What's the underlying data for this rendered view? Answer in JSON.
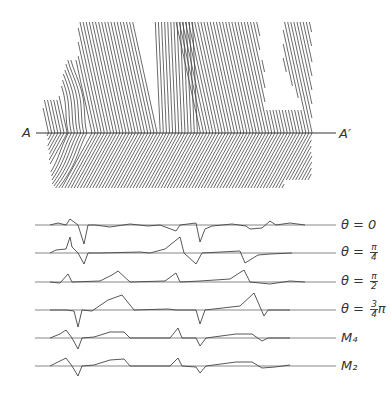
{
  "figure": {
    "section_line": {
      "start_label": "A",
      "end_label": "A′"
    },
    "traces": [
      {
        "name": "theta-0",
        "label_prefix": "θ = ",
        "label_main": "0",
        "frac": null,
        "suffix": ""
      },
      {
        "name": "theta-pi-4",
        "label_prefix": "θ = ",
        "label_main": "",
        "frac": {
          "num": "π",
          "den": "4"
        },
        "suffix": ""
      },
      {
        "name": "theta-pi-2",
        "label_prefix": "θ = ",
        "label_main": "",
        "frac": {
          "num": "π",
          "den": "2"
        },
        "suffix": ""
      },
      {
        "name": "theta-3pi-4",
        "label_prefix": "θ = ",
        "label_main": "",
        "frac": {
          "num": "3",
          "den": "4"
        },
        "suffix": "π"
      },
      {
        "name": "m4",
        "label_prefix": "",
        "label_main": "M₄",
        "frac": null,
        "suffix": ""
      },
      {
        "name": "m2",
        "label_prefix": "",
        "label_main": "M₂",
        "frac": null,
        "suffix": ""
      }
    ]
  },
  "trace_shapes": [
    [
      [
        50,
        0
      ],
      [
        58,
        2
      ],
      [
        66,
        0
      ],
      [
        70,
        6
      ],
      [
        74,
        3
      ],
      [
        78,
        0
      ],
      [
        84,
        -19
      ],
      [
        88,
        0
      ],
      [
        95,
        0
      ],
      [
        110,
        -2
      ],
      [
        130,
        1
      ],
      [
        148,
        -1
      ],
      [
        160,
        0
      ],
      [
        176,
        -6
      ],
      [
        180,
        0
      ],
      [
        196,
        2
      ],
      [
        200,
        -17
      ],
      [
        205,
        -4
      ],
      [
        212,
        -1
      ],
      [
        232,
        1
      ],
      [
        246,
        -1
      ],
      [
        250,
        -4
      ],
      [
        262,
        -3
      ],
      [
        270,
        4
      ],
      [
        276,
        0
      ],
      [
        290,
        2
      ],
      [
        305,
        0
      ]
    ],
    [
      [
        50,
        0
      ],
      [
        56,
        3
      ],
      [
        66,
        4
      ],
      [
        70,
        16
      ],
      [
        72,
        6
      ],
      [
        78,
        0
      ],
      [
        84,
        -11
      ],
      [
        88,
        0
      ],
      [
        100,
        0
      ],
      [
        140,
        1
      ],
      [
        150,
        0
      ],
      [
        165,
        4
      ],
      [
        180,
        16
      ],
      [
        184,
        0
      ],
      [
        196,
        -11
      ],
      [
        202,
        0
      ],
      [
        240,
        2
      ],
      [
        245,
        -10
      ],
      [
        258,
        -2
      ],
      [
        270,
        -1
      ],
      [
        292,
        0
      ]
    ],
    [
      [
        50,
        0
      ],
      [
        60,
        -1
      ],
      [
        68,
        8
      ],
      [
        72,
        0
      ],
      [
        100,
        1
      ],
      [
        112,
        7
      ],
      [
        118,
        11
      ],
      [
        130,
        0
      ],
      [
        165,
        1
      ],
      [
        176,
        9
      ],
      [
        180,
        0
      ],
      [
        200,
        1
      ],
      [
        230,
        3
      ],
      [
        244,
        12
      ],
      [
        250,
        0
      ],
      [
        270,
        -2
      ],
      [
        290,
        1
      ],
      [
        305,
        0
      ]
    ],
    [
      [
        50,
        0
      ],
      [
        66,
        0
      ],
      [
        74,
        -1
      ],
      [
        78,
        -17
      ],
      [
        82,
        0
      ],
      [
        92,
        -1
      ],
      [
        108,
        10
      ],
      [
        122,
        15
      ],
      [
        134,
        0
      ],
      [
        168,
        1
      ],
      [
        176,
        0
      ],
      [
        196,
        0
      ],
      [
        200,
        -14
      ],
      [
        205,
        0
      ],
      [
        240,
        4
      ],
      [
        254,
        17
      ],
      [
        264,
        -6
      ],
      [
        268,
        0
      ],
      [
        290,
        0
      ]
    ],
    [
      [
        50,
        0
      ],
      [
        60,
        4
      ],
      [
        66,
        8
      ],
      [
        72,
        0
      ],
      [
        78,
        -11
      ],
      [
        82,
        0
      ],
      [
        94,
        1
      ],
      [
        110,
        6
      ],
      [
        124,
        6
      ],
      [
        130,
        0
      ],
      [
        170,
        0
      ],
      [
        178,
        10
      ],
      [
        182,
        0
      ],
      [
        196,
        0
      ],
      [
        200,
        -8
      ],
      [
        206,
        0
      ],
      [
        236,
        4
      ],
      [
        252,
        4
      ],
      [
        262,
        -3
      ],
      [
        268,
        0
      ],
      [
        290,
        0
      ]
    ],
    [
      [
        50,
        0
      ],
      [
        60,
        5
      ],
      [
        66,
        8
      ],
      [
        72,
        0
      ],
      [
        78,
        -10
      ],
      [
        82,
        0
      ],
      [
        94,
        1
      ],
      [
        110,
        6
      ],
      [
        124,
        7
      ],
      [
        130,
        0
      ],
      [
        170,
        0
      ],
      [
        178,
        8
      ],
      [
        182,
        0
      ],
      [
        196,
        -1
      ],
      [
        200,
        -7
      ],
      [
        206,
        0
      ],
      [
        236,
        4
      ],
      [
        252,
        4
      ],
      [
        262,
        -2
      ],
      [
        275,
        -1
      ],
      [
        290,
        1
      ]
    ]
  ]
}
